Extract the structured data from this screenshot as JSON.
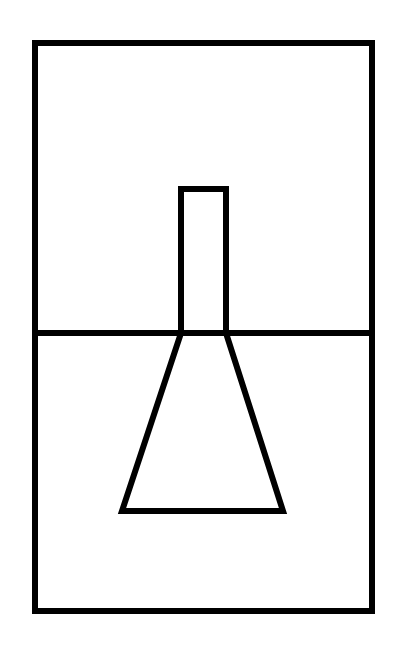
{
  "diagram": {
    "background": "#ffffff",
    "stroke_color": "#000000",
    "stroke_width": 6,
    "outer_frame": {
      "x": 35,
      "y": 43,
      "width": 337,
      "height": 568
    },
    "divider": {
      "x1": 35,
      "y1": 333,
      "x2": 372,
      "y2": 333
    },
    "neck": {
      "x": 181,
      "y": 189,
      "width": 45,
      "height": 144
    },
    "flask_body": {
      "points": "181,333 226,333 283,511 122,511"
    }
  }
}
